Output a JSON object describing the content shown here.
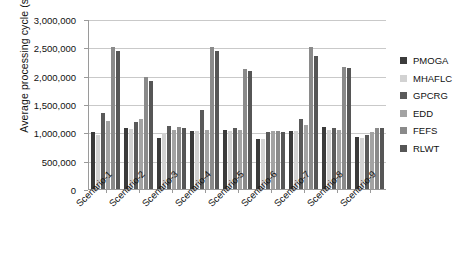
{
  "chart_data": {
    "type": "bar",
    "title": "",
    "xlabel": "",
    "ylabel": "Average processing cycle (s)",
    "ylim": [
      0,
      3000000
    ],
    "ytick_step": 500000,
    "ytick_labels": [
      "0",
      "500,000",
      "1,000,000",
      "1,500,000",
      "2,000,000",
      "2,500,000",
      "3,000,000"
    ],
    "ytick_values": [
      0,
      500000,
      1000000,
      1500000,
      2000000,
      2500000,
      3000000
    ],
    "grid": true,
    "legend_position": "right",
    "categories": [
      "Scenario-1",
      "Scenario-2",
      "Scenario-3",
      "Scenario-4",
      "Scenario-5",
      "Scenario-6",
      "Scenario-7",
      "Scenario-8",
      "Scenario-9"
    ],
    "series": [
      {
        "name": "PMOGA",
        "color": "#3b3b3b",
        "values": [
          1000000,
          1070000,
          900000,
          1030000,
          1040000,
          890000,
          1030000,
          1100000,
          920000
        ]
      },
      {
        "name": "MHAFLC",
        "color": "#d2d2d2",
        "values": [
          950000,
          1060000,
          980000,
          1030000,
          1030000,
          880000,
          1020000,
          1050000,
          900000
        ]
      },
      {
        "name": "GPCRG",
        "color": "#5a5a5a",
        "values": [
          1350000,
          1190000,
          1120000,
          1400000,
          1070000,
          1000000,
          1230000,
          1070000,
          950000
        ]
      },
      {
        "name": "EDD",
        "color": "#a3a3a3",
        "values": [
          1200000,
          1230000,
          1050000,
          1040000,
          1040000,
          1020000,
          1130000,
          1040000,
          1000000
        ]
      },
      {
        "name": "FEFS",
        "color": "#8a8a8a",
        "values": [
          2500000,
          1980000,
          1100000,
          2500000,
          2120000,
          1030000,
          2500000,
          2160000,
          1080000
        ]
      },
      {
        "name": "RLWT",
        "color": "#565656",
        "values": [
          2440000,
          1900000,
          1080000,
          2440000,
          2080000,
          1010000,
          2340000,
          2130000,
          1070000
        ]
      }
    ]
  }
}
